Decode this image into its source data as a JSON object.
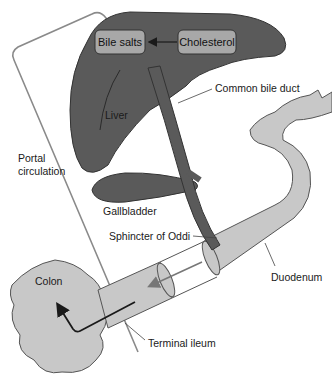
{
  "diagram": {
    "colors": {
      "liver": "#5a5a5a",
      "liver_outline": "#333333",
      "box_fill": "#a8a8a8",
      "intestine": "#c8c8c8",
      "intestine_outline": "#555555",
      "portal_line": "#888888",
      "arrow": "#1a1a1a",
      "background": "#ffffff"
    },
    "boxes": [
      {
        "id": "bile-salts",
        "label": "Bile salts"
      },
      {
        "id": "cholesterol",
        "label": "Cholesterol"
      }
    ],
    "labels": {
      "liver": "Liver",
      "common_bile_duct": "Common bile duct",
      "portal_circulation_line1": "Portal",
      "portal_circulation_line2": "circulation",
      "gallbladder": "Gallbladder",
      "sphincter": "Sphincter of Oddi",
      "duodenum": "Duodenum",
      "colon": "Colon",
      "terminal_ileum": "Terminal ileum"
    },
    "flows": [
      {
        "from": "Cholesterol",
        "to": "Bile salts"
      },
      {
        "from": "Duodenum",
        "to": "Terminal ileum"
      },
      {
        "from": "Terminal ileum",
        "to": "Colon"
      },
      {
        "from": "Terminal ileum",
        "to": "Liver",
        "via": "Portal circulation"
      }
    ]
  }
}
